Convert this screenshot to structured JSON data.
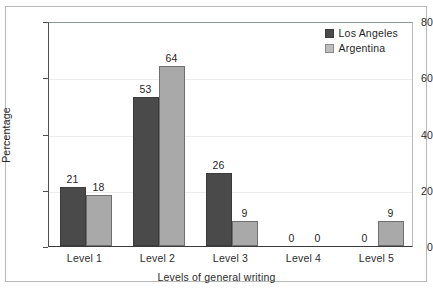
{
  "chart_data": {
    "type": "bar",
    "title": "",
    "subtitle": "",
    "xlabel": "Levels of general writing",
    "ylabel": "Percentage",
    "categories": [
      "Level 1",
      "Level 2",
      "Level 3",
      "Level 4",
      "Level 5"
    ],
    "series": [
      {
        "name": "Los Angeles",
        "color": "#4a4a4a",
        "values": [
          21,
          53,
          26,
          0,
          0
        ]
      },
      {
        "name": "Argentina",
        "color": "#a9a9a9",
        "values": [
          18,
          64,
          9,
          0,
          9
        ]
      }
    ],
    "ylim": [
      0,
      80
    ],
    "yticks": [
      0,
      20,
      40,
      60,
      80
    ],
    "ytick_labels": [
      "0",
      "20",
      "40",
      "60",
      "80"
    ],
    "grid": true,
    "grid_axis": "y",
    "legend_position": "top-right",
    "data_labels": true,
    "data_label_values": [
      [
        "21",
        "18"
      ],
      [
        "53",
        "64"
      ],
      [
        "26",
        "9"
      ],
      [
        "0",
        "0"
      ],
      [
        "0",
        "9"
      ]
    ]
  }
}
